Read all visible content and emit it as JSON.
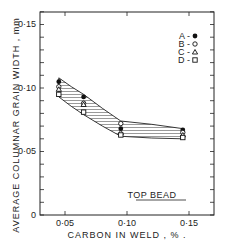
{
  "chart_data": {
    "type": "scatter",
    "title": "",
    "xlabel": "CARBON IN WELD , % .",
    "ylabel": "AVERAGE COLUMNAR GRAIN WIDTH , mm",
    "xlim": [
      0.03,
      0.17
    ],
    "ylim": [
      0,
      0.16
    ],
    "x_ticks": [
      0.05,
      0.1,
      0.15
    ],
    "x_tick_labels": [
      "0·05",
      "0·10",
      "0·15"
    ],
    "y_ticks": [
      0,
      0.05,
      0.1,
      0.15
    ],
    "y_tick_labels": [
      "0",
      "0·05",
      "0·10",
      "0·15"
    ],
    "grid": false,
    "legend_position": "upper right",
    "annotation": "TOP BEAD",
    "band": {
      "description": "hatched scatter band between upper and lower curves",
      "upper": [
        [
          0.045,
          0.108
        ],
        [
          0.065,
          0.095
        ],
        [
          0.095,
          0.074
        ],
        [
          0.145,
          0.068
        ]
      ],
      "lower": [
        [
          0.045,
          0.093
        ],
        [
          0.065,
          0.079
        ],
        [
          0.095,
          0.062
        ],
        [
          0.145,
          0.06
        ]
      ]
    },
    "series": [
      {
        "name": "A",
        "marker": "filled-circle",
        "x": [
          0.045,
          0.065,
          0.095,
          0.145
        ],
        "y": [
          0.105,
          0.093,
          0.068,
          0.067
        ]
      },
      {
        "name": "B",
        "marker": "open-circle",
        "x": [
          0.045,
          0.065,
          0.095,
          0.145
        ],
        "y": [
          0.101,
          0.088,
          0.072,
          0.065
        ]
      },
      {
        "name": "C",
        "marker": "open-triangle",
        "x": [
          0.045,
          0.065,
          0.095,
          0.145
        ],
        "y": [
          0.099,
          0.087,
          0.065,
          0.063
        ]
      },
      {
        "name": "D",
        "marker": "open-square",
        "x": [
          0.045,
          0.065,
          0.095,
          0.145
        ],
        "y": [
          0.095,
          0.081,
          0.063,
          0.061
        ]
      }
    ]
  },
  "legend": [
    {
      "label": "A -"
    },
    {
      "label": "B -"
    },
    {
      "label": "C -"
    },
    {
      "label": "D -"
    }
  ],
  "axes": {
    "x_title": "CARBON IN WELD , % .",
    "y_title": "AVERAGE COLUMNAR GRAIN WIDTH , mm",
    "x_labels": [
      "0·05",
      "0·10",
      "0·15"
    ],
    "y_labels": [
      "0",
      "0·05",
      "0·10",
      "0·15"
    ]
  },
  "annotation": "TOP BEAD"
}
